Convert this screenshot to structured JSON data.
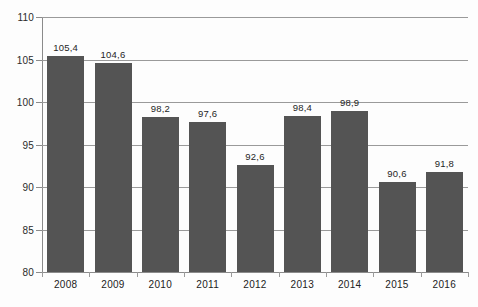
{
  "chart_data": {
    "type": "bar",
    "title": "",
    "subtitle": "",
    "xlabel": "",
    "ylabel": "",
    "categories": [
      "2008",
      "2009",
      "2010",
      "2011",
      "2012",
      "2013",
      "2014",
      "2015",
      "2016"
    ],
    "values": [
      105.4,
      104.6,
      98.2,
      97.6,
      92.6,
      98.4,
      98.9,
      90.6,
      91.8
    ],
    "value_labels": [
      "105,4",
      "104,6",
      "98,2",
      "97,6",
      "92,6",
      "98,4",
      "98,9",
      "90,6",
      "91,8"
    ],
    "decimal_separator": ",",
    "ylim": [
      80,
      110
    ],
    "ytick_step": 5,
    "ytick_values": [
      80,
      85,
      90,
      95,
      100,
      105,
      110
    ],
    "ytick_labels": [
      "80",
      "85",
      "90",
      "95",
      "100",
      "105",
      "110"
    ],
    "grid": true,
    "grid_axis": "y",
    "legend": false,
    "legend_position": "none",
    "bar_color": "#545454",
    "gridline_color": "#9a9a9a",
    "axis_color": "#8b8b8b",
    "label_color": "#252525",
    "background_color": "#fdfdfd"
  }
}
